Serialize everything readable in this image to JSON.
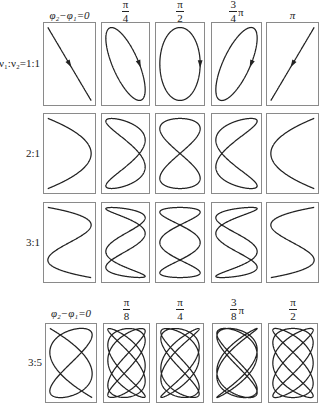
{
  "stroke_color": "#222222",
  "border_color": "#8a8a8a",
  "header_top": [
    {
      "type": "plain",
      "text": "φ₂−φ₁=0"
    },
    {
      "type": "frac",
      "num": "π",
      "den": "4",
      "suffix": ""
    },
    {
      "type": "frac",
      "num": "π",
      "den": "2",
      "suffix": ""
    },
    {
      "type": "frac",
      "num": "3",
      "den": "4",
      "suffix": "π"
    },
    {
      "type": "plain",
      "text": "π"
    }
  ],
  "header_bottom": [
    {
      "type": "plain",
      "text": "φ₂−φ₁=0"
    },
    {
      "type": "frac",
      "num": "π",
      "den": "8",
      "suffix": ""
    },
    {
      "type": "frac",
      "num": "π",
      "den": "4",
      "suffix": ""
    },
    {
      "type": "frac",
      "num": "3",
      "den": "8",
      "suffix": "π"
    },
    {
      "type": "frac",
      "num": "π",
      "den": "2",
      "suffix": ""
    }
  ],
  "rows": [
    {
      "label": "ν₁:ν₂=1:1",
      "fx": 1,
      "fy": 1,
      "phases": [
        0,
        0.7854,
        1.5708,
        2.3562,
        3.1416
      ],
      "arrows": true
    },
    {
      "label": "2:1",
      "fx": 2,
      "fy": 1,
      "phases": [
        0,
        0.7854,
        1.5708,
        2.3562,
        3.1416
      ],
      "arrows": false
    },
    {
      "label": "3:1",
      "fx": 3,
      "fy": 1,
      "phases": [
        0,
        0.7854,
        1.5708,
        2.3562,
        3.1416
      ],
      "arrows": false
    },
    {
      "label": "3:5",
      "fx": 5,
      "fy": 3,
      "phases": [
        0,
        0.3927,
        0.7854,
        1.1781,
        1.5708
      ],
      "arrows": false
    }
  ]
}
